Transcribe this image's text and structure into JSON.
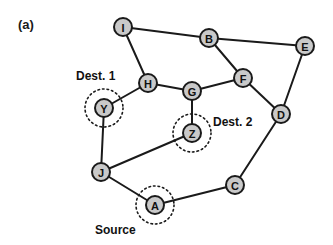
{
  "figure": {
    "panel_label": "(a)",
    "width": 333,
    "height": 245,
    "background_color": "#ffffff",
    "node_fill_color": "#c9c9c9",
    "node_stroke_color": "#1a1a1a",
    "edge_color": "#1a1a1a",
    "node_radius": 9,
    "highlight_radius": 19
  },
  "nodes": [
    {
      "id": "I",
      "label": "I",
      "x": 123,
      "y": 27,
      "highlighted": false
    },
    {
      "id": "B",
      "label": "B",
      "x": 209,
      "y": 38,
      "highlighted": false
    },
    {
      "id": "E",
      "label": "E",
      "x": 305,
      "y": 46,
      "highlighted": false
    },
    {
      "id": "F",
      "label": "F",
      "x": 243,
      "y": 78,
      "highlighted": false
    },
    {
      "id": "H",
      "label": "H",
      "x": 148,
      "y": 83,
      "highlighted": false
    },
    {
      "id": "G",
      "label": "G",
      "x": 192,
      "y": 91,
      "highlighted": false
    },
    {
      "id": "Y",
      "label": "Y",
      "x": 104,
      "y": 108,
      "highlighted": true
    },
    {
      "id": "D",
      "label": "D",
      "x": 281,
      "y": 114,
      "highlighted": false
    },
    {
      "id": "Z",
      "label": "Z",
      "x": 192,
      "y": 133,
      "highlighted": true
    },
    {
      "id": "J",
      "label": "J",
      "x": 101,
      "y": 172,
      "highlighted": false
    },
    {
      "id": "C",
      "label": "C",
      "x": 235,
      "y": 185,
      "highlighted": false
    },
    {
      "id": "A",
      "label": "A",
      "x": 155,
      "y": 205,
      "highlighted": true
    }
  ],
  "edges": [
    {
      "from": "I",
      "to": "B"
    },
    {
      "from": "I",
      "to": "H"
    },
    {
      "from": "B",
      "to": "E"
    },
    {
      "from": "B",
      "to": "F"
    },
    {
      "from": "E",
      "to": "D"
    },
    {
      "from": "F",
      "to": "G"
    },
    {
      "from": "F",
      "to": "D"
    },
    {
      "from": "H",
      "to": "G"
    },
    {
      "from": "H",
      "to": "Y"
    },
    {
      "from": "G",
      "to": "Z"
    },
    {
      "from": "Y",
      "to": "J"
    },
    {
      "from": "D",
      "to": "C"
    },
    {
      "from": "Z",
      "to": "J"
    },
    {
      "from": "J",
      "to": "A"
    },
    {
      "from": "A",
      "to": "C"
    }
  ],
  "annotations": [
    {
      "id": "dest1",
      "text": "Dest. 1",
      "x": 76,
      "y": 80,
      "anchor": "start",
      "node": "Y"
    },
    {
      "id": "dest2",
      "text": "Dest. 2",
      "x": 213,
      "y": 126,
      "anchor": "start",
      "node": "Z"
    },
    {
      "id": "source",
      "text": "Source",
      "x": 95,
      "y": 234,
      "anchor": "start",
      "node": "A"
    }
  ],
  "panel": {
    "label_x": 18,
    "label_y": 29
  }
}
